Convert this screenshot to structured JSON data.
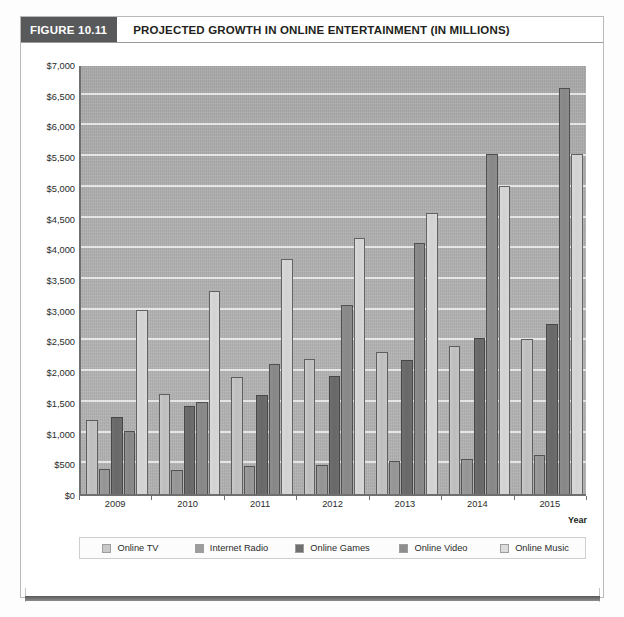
{
  "figure": {
    "number_label": "FIGURE 10.11",
    "title": "PROJECTED GROWTH IN ONLINE ENTERTAINMENT (IN MILLIONS)"
  },
  "chart_data": {
    "type": "bar",
    "title": "PROJECTED GROWTH IN ONLINE ENTERTAINMENT (IN MILLIONS)",
    "xlabel": "Year",
    "ylabel": "",
    "ylim": [
      0,
      7000
    ],
    "ytick_step": 500,
    "grid": true,
    "legend_position": "bottom",
    "categories": [
      "2009",
      "2010",
      "2011",
      "2012",
      "2013",
      "2014",
      "2015"
    ],
    "ytick_labels": [
      "$0",
      "$500",
      "$1,000",
      "$1,500",
      "$2,000",
      "$2,500",
      "$3,000",
      "$3,500",
      "$4,000",
      "$4,500",
      "$5,000",
      "$5,500",
      "$6,000",
      "$6,500",
      "$7,000"
    ],
    "series": [
      {
        "name": "Online TV",
        "color": "#c9c9c9",
        "values": [
          1200,
          1630,
          1900,
          2200,
          2310,
          2410,
          2520
        ]
      },
      {
        "name": "Internet Radio",
        "color": "#9d9d9d",
        "values": [
          400,
          390,
          450,
          480,
          530,
          570,
          640
        ]
      },
      {
        "name": "Online Games",
        "color": "#6f6f6f",
        "values": [
          1250,
          1430,
          1620,
          1920,
          2180,
          2540,
          2760
        ]
      },
      {
        "name": "Online Video",
        "color": "#8e8e8e",
        "values": [
          1020,
          1500,
          2110,
          3080,
          4090,
          5530,
          6610
        ]
      },
      {
        "name": "Online Music",
        "color": "#d9d9d9",
        "values": [
          3000,
          3300,
          3830,
          4160,
          4580,
          5010,
          5530
        ]
      }
    ]
  }
}
